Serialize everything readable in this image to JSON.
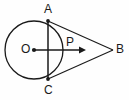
{
  "figure": {
    "name": "circle-with-tangent-lines-from-external-point",
    "background_color": "#fefefe",
    "stroke_color": "#1a1a1a",
    "width": 129,
    "height": 100,
    "labels": {
      "A": "A",
      "B": "B",
      "C": "C",
      "O": "O",
      "P": "P"
    },
    "points": {
      "O": {
        "x": 34,
        "y": 50,
        "role": "circle-center",
        "marked": true
      },
      "A": {
        "x": 48,
        "y": 21,
        "role": "tangent-point-upper",
        "marked": true
      },
      "C": {
        "x": 48,
        "y": 79,
        "role": "tangent-point-lower",
        "marked": true
      },
      "B": {
        "x": 113,
        "y": 50,
        "role": "external-apex",
        "marked": false
      },
      "P": {
        "x": 48,
        "y": 50,
        "role": "chord-radius-intersection",
        "marked": false
      }
    },
    "circle": {
      "center_x": 34,
      "center_y": 50,
      "radius": 29
    },
    "segments": [
      {
        "name": "chord-AC",
        "from": "A",
        "to": "C"
      },
      {
        "name": "tangent-AB",
        "from": "A",
        "to": "B"
      },
      {
        "name": "tangent-CB",
        "from": "C",
        "to": "B"
      },
      {
        "name": "radius-ray-OB",
        "from": "O",
        "to": "B",
        "arrow": true,
        "arrow_tip_x": 85
      }
    ]
  }
}
